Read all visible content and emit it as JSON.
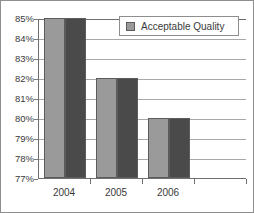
{
  "chart_data": {
    "type": "bar",
    "title": "",
    "xlabel": "",
    "ylabel": "",
    "categories": [
      "2004",
      "2005",
      "2006"
    ],
    "series": [
      {
        "name": "Acceptable Quality",
        "values": [
          85,
          82,
          80
        ],
        "color": "#9a9a9a"
      },
      {
        "name": "Acceptable Quality",
        "values": [
          85,
          82,
          80
        ],
        "color": "#4a4a4a"
      }
    ],
    "ylim": [
      77,
      85
    ],
    "ytick_step": 1,
    "ytick_labels": [
      "85%",
      "84%",
      "83%",
      "82%",
      "81%",
      "80%",
      "79%",
      "78%",
      "77%"
    ],
    "ytick_values": [
      85,
      84,
      83,
      82,
      81,
      80,
      79,
      78,
      77
    ],
    "grid": "horizontal",
    "legend_position": "top-right-inside",
    "legend_entries": [
      "Acceptable Quality"
    ],
    "value_suffix": "%"
  },
  "legend": {
    "label": "Acceptable Quality",
    "swatch_color": "#9a9a9a"
  },
  "colors": {
    "series_light": "#9a9a9a",
    "series_dark": "#4a4a4a",
    "gridline": "#a8a8a8",
    "axis": "#6f6f6f",
    "border": "#8e8e8e",
    "text": "#3a3a3a",
    "plot_background": "#ffffff"
  }
}
